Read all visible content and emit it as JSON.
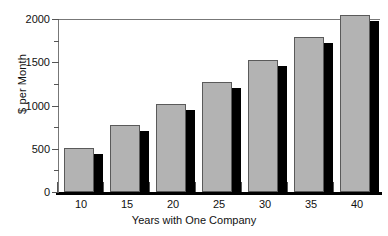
{
  "chart_data": {
    "type": "bar",
    "title": "",
    "xlabel": "Years with One Company",
    "ylabel": "$ per Month",
    "categories": [
      "10",
      "15",
      "20",
      "25",
      "30",
      "35",
      "40"
    ],
    "values": [
      510,
      770,
      1020,
      1270,
      1530,
      1790,
      2050
    ],
    "series": [
      {
        "name": "$ per Month",
        "values": [
          510,
          770,
          1020,
          1270,
          1530,
          1790,
          2050
        ]
      }
    ],
    "ylim": [
      0,
      2000
    ],
    "ytick_labels": [
      "0",
      "500",
      "1000",
      "1500",
      "2000"
    ],
    "ytick_values": [
      0,
      500,
      1000,
      1500,
      2000
    ],
    "yminor_tick_values": [
      250,
      750,
      1250,
      1750
    ],
    "xtick_labels": [
      "10",
      "15",
      "20",
      "25",
      "30",
      "35",
      "40"
    ],
    "grid": false,
    "legend": null,
    "legend_position": "none",
    "bar_style": "3d-drop-shadow",
    "colors": {
      "bar_face": "#b3b3b3",
      "bar_edge": "#5a5a5a",
      "bar_shadow": "#000000",
      "axis": "#777777",
      "baseline": "#000000",
      "text": "#111111",
      "background": "#ffffff"
    }
  }
}
